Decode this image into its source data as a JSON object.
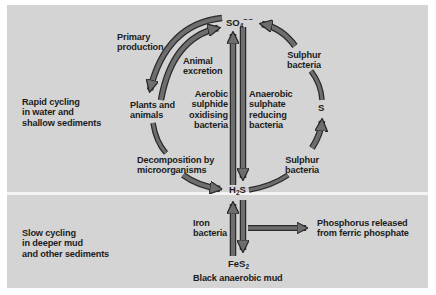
{
  "zones": {
    "upper": {
      "lines": [
        "Rapid cycling",
        "in water and",
        "shallow sediments"
      ]
    },
    "lower": {
      "lines": [
        "Slow cycling",
        "in deeper mud",
        "and other sediments"
      ]
    }
  },
  "nodes": {
    "sulphate": {
      "base": "SO",
      "sub": "4",
      "sup": "−−"
    },
    "hydrogen_sulphide": {
      "base": "H",
      "sub": "2",
      "rest": "S"
    },
    "sulphur": {
      "label": "S"
    },
    "pyrite": {
      "base": "FeS",
      "sub": "2"
    },
    "pyrite_caption": {
      "label": "Black anaerobic mud"
    },
    "plants_animals": {
      "lines": [
        "Plants and",
        "animals"
      ]
    },
    "phosphorus": {
      "lines": [
        "Phosphorus released",
        "from ferric phosphate"
      ]
    }
  },
  "processes": {
    "primary_production": {
      "lines": [
        "Primary",
        "production"
      ]
    },
    "animal_excretion": {
      "lines": [
        "Animal",
        "excretion"
      ]
    },
    "aerobic_oxidising": {
      "lines": [
        "Aerobic",
        "sulphide",
        "oxidising",
        "bacteria"
      ]
    },
    "anaerobic_reducing": {
      "lines": [
        "Anaerobic",
        "sulphate",
        "reducing",
        "bacteria"
      ]
    },
    "decomposition": {
      "lines": [
        "Decomposition by",
        "microorganisms"
      ]
    },
    "sulphur_bacteria_top": {
      "lines": [
        "Sulphur",
        "bacteria"
      ]
    },
    "sulphur_bacteria_bottom": {
      "lines": [
        "Sulphur",
        "bacteria"
      ]
    },
    "iron_bacteria": {
      "lines": [
        "Iron",
        "bacteria"
      ]
    }
  },
  "colors": {
    "panel": "#d4d4d4",
    "divider": "#f4f4f4",
    "arrow_fill": "#6e6e6e",
    "arrow_stroke": "#2a2a2a",
    "text": "#1c1c1c"
  }
}
